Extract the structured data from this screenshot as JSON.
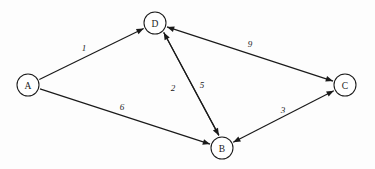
{
  "diagram": {
    "type": "directed-weighted-graph",
    "background_color": "#fdfdfd",
    "stroke_color": "#1a1a1a",
    "node_fill_color": "#ffffff",
    "nodes": [
      {
        "id": "A",
        "label": "A",
        "x": 28,
        "y": 85,
        "r": 11
      },
      {
        "id": "D",
        "label": "D",
        "x": 155,
        "y": 23,
        "r": 11
      },
      {
        "id": "B",
        "label": "B",
        "x": 222,
        "y": 148,
        "r": 11
      },
      {
        "id": "C",
        "label": "C",
        "x": 345,
        "y": 85,
        "r": 11
      }
    ],
    "edges": [
      {
        "id": "a-d",
        "from": "A",
        "to": "D",
        "weight": "1",
        "directed": "one-way",
        "label_x": 84,
        "label_y": 48
      },
      {
        "id": "a-b",
        "from": "A",
        "to": "B",
        "weight": "6",
        "directed": "one-way",
        "label_x": 122,
        "label_y": 107
      },
      {
        "id": "d-b",
        "from": "D",
        "to": "B",
        "weight": "2",
        "directed": "one-way",
        "label_x": 173,
        "label_y": 88
      },
      {
        "id": "b-d",
        "from": "B",
        "to": "D",
        "weight": "5",
        "directed": "one-way",
        "label_x": 202,
        "label_y": 85
      },
      {
        "id": "d-c",
        "from": "D",
        "to": "C",
        "weight": "9",
        "directed": "bidirectional",
        "label_x": 250,
        "label_y": 44
      },
      {
        "id": "b-c",
        "from": "B",
        "to": "C",
        "weight": "3",
        "directed": "bidirectional",
        "label_x": 283,
        "label_y": 110
      }
    ]
  }
}
